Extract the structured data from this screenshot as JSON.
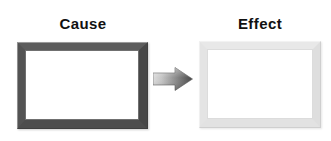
{
  "diagram": {
    "type": "cause-effect",
    "background_color": "#ffffff",
    "width": 331,
    "height": 141,
    "nodes": [
      {
        "id": "cause",
        "label": "Cause",
        "shape": "picture-frame",
        "frame_color": "#4d4d4d",
        "frame_tone": "dark",
        "fill_color": "#ffffff"
      },
      {
        "id": "effect",
        "label": "Effect",
        "shape": "picture-frame",
        "frame_color": "#e4e4e4",
        "frame_tone": "light",
        "fill_color": "#ffffff"
      }
    ],
    "connector": {
      "id": "arrow-cause-to-effect",
      "icon": "right-arrow-icon",
      "direction": "right",
      "from": "cause",
      "to": "effect",
      "gradient_start_color": "#d4d4d4",
      "gradient_end_color": "#4a4a4a"
    },
    "label_color": "#111111"
  }
}
